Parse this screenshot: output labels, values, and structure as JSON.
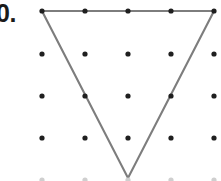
{
  "figure": {
    "label": "0.",
    "label_note": "problem number, cropped at left edge of image",
    "background_color": "#ffffff",
    "canvas": {
      "width": 221,
      "height": 181
    }
  },
  "dot_grid": {
    "rows": 5,
    "columns": 5,
    "x_positions": [
      42,
      85,
      128,
      171,
      214
    ],
    "y_positions": [
      11,
      54,
      96,
      138,
      180
    ],
    "spacing_x": 43,
    "spacing_y": 42,
    "dot_radius": 2.6,
    "dot_color": "#1f1f1f",
    "note": "bottom row clipped by the image edge"
  },
  "shape": {
    "name": "inverted-triangle",
    "type": "polygon",
    "stroke_color": "#7d7d7d",
    "stroke_width": 2.1,
    "fill": "none",
    "vertices": [
      {
        "name": "top-left",
        "x": 42,
        "y": 11,
        "grid": [
          0,
          0
        ]
      },
      {
        "name": "top-right",
        "x": 214,
        "y": 11,
        "grid": [
          4,
          0
        ]
      },
      {
        "name": "bottom-center",
        "x": 128,
        "y": 178,
        "grid": [
          2,
          4
        ]
      }
    ],
    "points_string": "42,11 214,11 128,178",
    "lattice_points_on_edges": [
      {
        "x": 85,
        "y": 96
      },
      {
        "x": 171,
        "y": 96
      },
      {
        "x": 85,
        "y": 11
      },
      {
        "x": 128,
        "y": 11
      },
      {
        "x": 171,
        "y": 11
      }
    ]
  }
}
